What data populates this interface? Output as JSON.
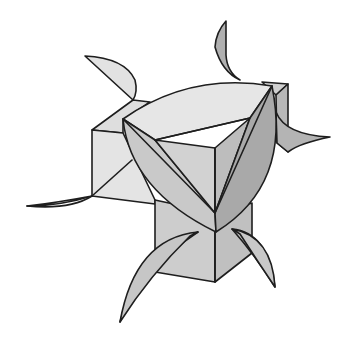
{
  "figure": {
    "colors": {
      "background": "#ffffff",
      "stroke": "#1e1e1e",
      "light": "#e9e9e9",
      "mid_light": "#d9d9d9",
      "mid": "#c6c6c6",
      "dark": "#ababab"
    }
  }
}
